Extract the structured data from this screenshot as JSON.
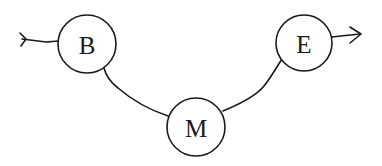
{
  "diagram": {
    "type": "state-path",
    "colors": {
      "stroke": "#1a1a1a",
      "background": "#ffffff"
    },
    "nodes": [
      {
        "id": "B",
        "label": "B",
        "cx": 87,
        "cy": 44,
        "r": 29
      },
      {
        "id": "M",
        "label": "M",
        "cx": 196,
        "cy": 127,
        "r": 29
      },
      {
        "id": "E",
        "label": "E",
        "cx": 304,
        "cy": 43,
        "r": 28
      }
    ],
    "edges": [
      {
        "from": "entry",
        "to": "B",
        "kind": "incoming-tail"
      },
      {
        "from": "B",
        "to": "M",
        "kind": "curve"
      },
      {
        "from": "M",
        "to": "E",
        "kind": "curve"
      },
      {
        "from": "E",
        "to": "exit",
        "kind": "outgoing-arrow"
      }
    ]
  }
}
